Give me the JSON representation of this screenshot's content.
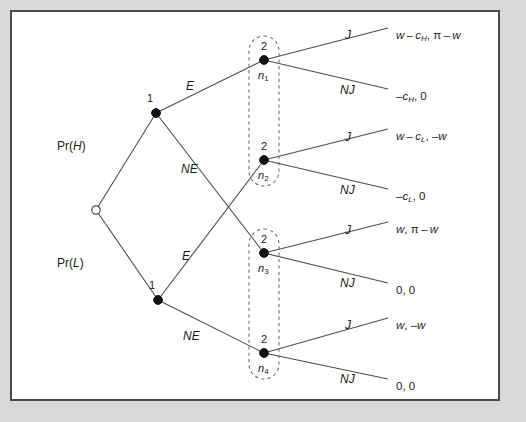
{
  "figure": {
    "kind": "extensive-form-game-tree",
    "background_color": "#d9d9d9",
    "panel_color": "#ffffff",
    "frame_color": "#4a4a4a",
    "edge_color": "#4d4d4d",
    "node_color": "#111111"
  },
  "chance_node": {
    "name": "chance-root",
    "shape": "open-circle",
    "x": 96,
    "y": 210
  },
  "probability_labels": [
    {
      "id": "pr-high",
      "text": "Pr(H)",
      "prefix": "Pr(",
      "variable": "H",
      "suffix": ")",
      "x": 57,
      "y": 140
    },
    {
      "id": "pr-low",
      "text": "Pr(L)",
      "prefix": "Pr(",
      "variable": "L",
      "suffix": ")",
      "x": 57,
      "y": 257
    }
  ],
  "player1_nodes": [
    {
      "id": "p1-high",
      "player_label": "1",
      "x": 156,
      "y": 113
    },
    {
      "id": "p1-low",
      "player_label": "1",
      "x": 158,
      "y": 300
    }
  ],
  "player2_nodes": [
    {
      "id": "n1",
      "player_label": "2",
      "node_label": "n",
      "subscript": "1",
      "x": 264,
      "y": 60
    },
    {
      "id": "n2",
      "player_label": "2",
      "node_label": "n",
      "subscript": "2",
      "x": 264,
      "y": 160
    },
    {
      "id": "n3",
      "player_label": "2",
      "node_label": "n",
      "subscript": "3",
      "x": 264,
      "y": 253
    },
    {
      "id": "n4",
      "player_label": "2",
      "node_label": "n",
      "subscript": "4",
      "x": 264,
      "y": 353
    }
  ],
  "information_sets": [
    {
      "id": "infoset-upper",
      "contains": [
        "n1",
        "n2"
      ],
      "x": 264,
      "y_top": 36,
      "y_bottom": 186
    },
    {
      "id": "infoset-lower",
      "contains": [
        "n3",
        "n4"
      ],
      "x": 264,
      "y_top": 229,
      "y_bottom": 379
    }
  ],
  "player1_actions": [
    {
      "id": "action-E-high",
      "label": "E",
      "from": "p1-high",
      "to": "n1",
      "x": 186,
      "y": 80
    },
    {
      "id": "action-NE-high",
      "label": "NE",
      "from": "p1-high",
      "to": "n3",
      "x": 181,
      "y": 163
    },
    {
      "id": "action-E-low",
      "label": "E",
      "from": "p1-low",
      "to": "n2",
      "x": 182,
      "y": 250
    },
    {
      "id": "action-NE-low",
      "label": "NE",
      "from": "p1-low",
      "to": "n4",
      "x": 183,
      "y": 330
    }
  ],
  "player2_actions": [
    {
      "id": "action-J-n1",
      "label": "J",
      "from": "n1",
      "x": 345,
      "y": 29
    },
    {
      "id": "action-NJ-n1",
      "label": "NJ",
      "from": "n1",
      "x": 340,
      "y": 84
    },
    {
      "id": "action-J-n2",
      "label": "J",
      "from": "n2",
      "x": 345,
      "y": 131
    },
    {
      "id": "action-NJ-n2",
      "label": "NJ",
      "from": "n2",
      "x": 340,
      "y": 184
    },
    {
      "id": "action-J-n3",
      "label": "J",
      "from": "n3",
      "x": 345,
      "y": 224
    },
    {
      "id": "action-NJ-n3",
      "label": "NJ",
      "from": "n3",
      "x": 340,
      "y": 277
    },
    {
      "id": "action-J-n4",
      "label": "J",
      "from": "n4",
      "x": 345,
      "y": 319
    },
    {
      "id": "action-NJ-n4",
      "label": "NJ",
      "from": "n4",
      "x": 340,
      "y": 373
    }
  ],
  "payoffs": [
    {
      "id": "payoff-n1-J",
      "from": "n1",
      "action": "J",
      "text": "w - c_H, π - w",
      "parts": [
        {
          "t": "w",
          "s": "italic"
        },
        {
          "t": " – ",
          "s": "plain"
        },
        {
          "t": "c",
          "s": "italic"
        },
        {
          "t": "H",
          "s": "sub"
        },
        {
          "t": ", ",
          "s": "plain"
        },
        {
          "t": "π",
          "s": "upright"
        },
        {
          "t": " – ",
          "s": "plain"
        },
        {
          "t": "w",
          "s": "italic"
        }
      ],
      "x": 396,
      "y": 30
    },
    {
      "id": "payoff-n1-NJ",
      "from": "n1",
      "action": "NJ",
      "text": "-c_H, 0",
      "parts": [
        {
          "t": "–",
          "s": "plain"
        },
        {
          "t": "c",
          "s": "italic"
        },
        {
          "t": "H",
          "s": "sub"
        },
        {
          "t": ", 0",
          "s": "plain"
        }
      ],
      "x": 396,
      "y": 91
    },
    {
      "id": "payoff-n2-J",
      "from": "n2",
      "action": "J",
      "text": "w - c_L, -w",
      "parts": [
        {
          "t": "w",
          "s": "italic"
        },
        {
          "t": " – ",
          "s": "plain"
        },
        {
          "t": "c",
          "s": "italic"
        },
        {
          "t": "L",
          "s": "sub"
        },
        {
          "t": ", –",
          "s": "plain"
        },
        {
          "t": "w",
          "s": "italic"
        }
      ],
      "x": 396,
      "y": 131
    },
    {
      "id": "payoff-n2-NJ",
      "from": "n2",
      "action": "NJ",
      "text": "-c_L, 0",
      "parts": [
        {
          "t": "–",
          "s": "plain"
        },
        {
          "t": "c",
          "s": "italic"
        },
        {
          "t": "L",
          "s": "sub"
        },
        {
          "t": ", 0",
          "s": "plain"
        }
      ],
      "x": 396,
      "y": 191
    },
    {
      "id": "payoff-n3-J",
      "from": "n3",
      "action": "J",
      "text": "w, π - w",
      "parts": [
        {
          "t": "w",
          "s": "italic"
        },
        {
          "t": ", ",
          "s": "plain"
        },
        {
          "t": "π",
          "s": "upright"
        },
        {
          "t": " – ",
          "s": "plain"
        },
        {
          "t": "w",
          "s": "italic"
        }
      ],
      "x": 396,
      "y": 224
    },
    {
      "id": "payoff-n3-NJ",
      "from": "n3",
      "action": "NJ",
      "text": "0, 0",
      "parts": [
        {
          "t": "0, 0",
          "s": "plain"
        }
      ],
      "x": 396,
      "y": 285
    },
    {
      "id": "payoff-n4-J",
      "from": "n4",
      "action": "J",
      "text": "w, -w",
      "parts": [
        {
          "t": "w",
          "s": "italic"
        },
        {
          "t": ", –",
          "s": "plain"
        },
        {
          "t": "w",
          "s": "italic"
        }
      ],
      "x": 396,
      "y": 320
    },
    {
      "id": "payoff-n4-NJ",
      "from": "n4",
      "action": "NJ",
      "text": "0, 0",
      "parts": [
        {
          "t": "0, 0",
          "s": "plain"
        }
      ],
      "x": 396,
      "y": 381
    }
  ],
  "edges": [
    {
      "id": "edge-chance-high",
      "x1": 96,
      "y1": 210,
      "x2": 156,
      "y2": 113
    },
    {
      "id": "edge-chance-low",
      "x1": 96,
      "y1": 210,
      "x2": 158,
      "y2": 300
    },
    {
      "id": "edge-p1high-E",
      "x1": 156,
      "y1": 113,
      "x2": 264,
      "y2": 60
    },
    {
      "id": "edge-p1high-NE",
      "x1": 156,
      "y1": 113,
      "x2": 264,
      "y2": 253
    },
    {
      "id": "edge-p1low-E",
      "x1": 158,
      "y1": 300,
      "x2": 264,
      "y2": 160
    },
    {
      "id": "edge-p1low-NE",
      "x1": 158,
      "y1": 300,
      "x2": 264,
      "y2": 353
    },
    {
      "id": "edge-n1-J",
      "x1": 264,
      "y1": 60,
      "x2": 388,
      "y2": 28
    },
    {
      "id": "edge-n1-NJ",
      "x1": 264,
      "y1": 60,
      "x2": 388,
      "y2": 89
    },
    {
      "id": "edge-n2-J",
      "x1": 264,
      "y1": 160,
      "x2": 388,
      "y2": 129
    },
    {
      "id": "edge-n2-NJ",
      "x1": 264,
      "y1": 160,
      "x2": 388,
      "y2": 189
    },
    {
      "id": "edge-n3-J",
      "x1": 264,
      "y1": 253,
      "x2": 388,
      "y2": 222
    },
    {
      "id": "edge-n3-NJ",
      "x1": 264,
      "y1": 253,
      "x2": 388,
      "y2": 283
    },
    {
      "id": "edge-n4-J",
      "x1": 264,
      "y1": 353,
      "x2": 388,
      "y2": 318
    },
    {
      "id": "edge-n4-NJ",
      "x1": 264,
      "y1": 353,
      "x2": 388,
      "y2": 379
    }
  ]
}
